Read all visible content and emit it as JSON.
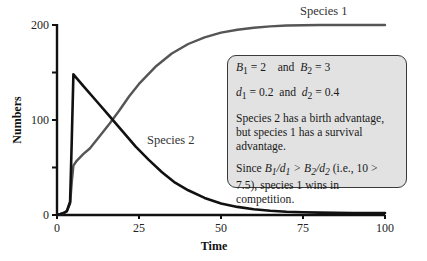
{
  "chart_data": {
    "type": "line",
    "title": "",
    "xlabel": "Time",
    "ylabel": "Numbers",
    "xlim": [
      0,
      100
    ],
    "ylim": [
      0,
      200
    ],
    "x_ticks": [
      0,
      25,
      50,
      75,
      100
    ],
    "y_ticks": [
      0,
      50,
      100,
      150,
      200
    ],
    "y_tick_labels": [
      "0",
      "",
      "100",
      "",
      "200"
    ],
    "grid": false,
    "series": [
      {
        "name": "Species 1",
        "color": "#555555",
        "x": [
          0,
          1,
          2,
          3,
          4,
          4.5,
          5,
          6,
          8,
          10,
          13,
          16,
          19,
          22,
          25,
          30,
          35,
          40,
          45,
          50,
          55,
          60,
          65,
          70,
          80,
          90,
          100
        ],
        "y": [
          0,
          1,
          2,
          4,
          12,
          35,
          52,
          57,
          64,
          70,
          83,
          96,
          110,
          125,
          138,
          156,
          170,
          180,
          187,
          192,
          195,
          197,
          198.5,
          199.5,
          200,
          200,
          200
        ]
      },
      {
        "name": "Species 2",
        "color": "#111111",
        "x": [
          0,
          1,
          2,
          3,
          4,
          4.5,
          5,
          8,
          12,
          16,
          20,
          24,
          28,
          32,
          36,
          40,
          45,
          50,
          55,
          60,
          65,
          70,
          75,
          80,
          90,
          100
        ],
        "y": [
          0,
          1,
          2,
          4,
          14,
          80,
          148,
          136,
          120,
          104,
          88,
          72,
          58,
          45,
          34,
          26,
          18,
          12,
          8.5,
          6,
          4.5,
          3.5,
          3,
          2.5,
          2,
          2
        ]
      }
    ],
    "annotations": [
      {
        "text": "Species 1",
        "near": "top-right of species 1 curve"
      },
      {
        "text": "Species 2",
        "near": "middle of species 2 curve"
      }
    ]
  },
  "info_box": {
    "line1_a": "B",
    "line1_a_sub": "1",
    "line1_a_val": " = 2",
    "line1_and": "and",
    "line1_b": "B",
    "line1_b_sub": "2",
    "line1_b_val": " = 3",
    "line2_a": "d",
    "line2_a_sub": "1",
    "line2_a_val": " = 0.2",
    "line2_and": "and",
    "line2_b": "d",
    "line2_b_sub": "2",
    "line2_b_val": " = 0.4",
    "para1": "Species 2 has a birth advantage, but species 1 has a survival advantage.",
    "para2_prefix": "Since ",
    "para2_formula": "B1/d1 > B2/d2",
    "para2_suffix": " (i.e., 10 > 7.5), species 1 wins in competition."
  }
}
